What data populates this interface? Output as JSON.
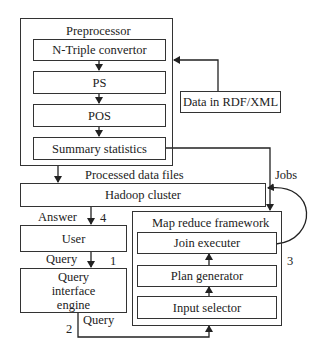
{
  "preprocessor": {
    "title": "Preprocessor",
    "steps": [
      "N-Triple convertor",
      "PS",
      "POS",
      "Summary statistics"
    ]
  },
  "input_source": "Data in RDF/XML",
  "processed_label": "Processed data files",
  "hadoop": "Hadoop cluster",
  "jobs_label": "Jobs",
  "answer_label": "Answer",
  "user": "User",
  "query_label_1": "Query",
  "query_engine": "Query interface engine",
  "query_label_2": "Query",
  "mapreduce": {
    "title": "Map reduce framework",
    "components": [
      "Join executer",
      "Plan generator",
      "Input selector"
    ]
  },
  "step_numbers": {
    "one": "1",
    "two": "2",
    "three": "3",
    "four": "4"
  }
}
